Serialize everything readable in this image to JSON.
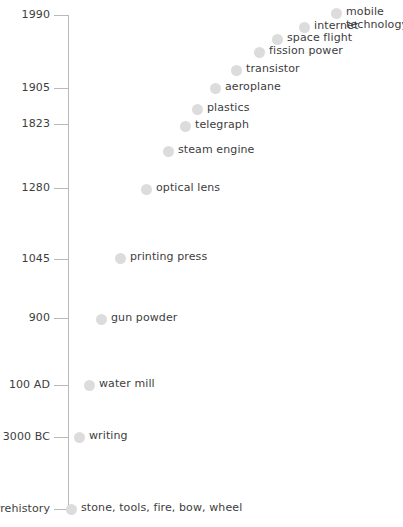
{
  "chart_data": {
    "type": "scatter",
    "title": "",
    "xlabel": "",
    "ylabel": "",
    "orientation": "vertical-timeline",
    "axis": {
      "line_color": "#b9b9b9",
      "x_px": 68,
      "top_px": 15,
      "bottom_px": 509
    },
    "dot_color": "#dcdcdc",
    "text_color": "#3d3d3d",
    "tick_labels": [
      "1990",
      "1905",
      "1823",
      "1280",
      "1045",
      "900",
      "100 AD",
      "3000 BC",
      "Prehistory"
    ],
    "ticks": [
      {
        "label": "1990",
        "y": 15,
        "label_right": 50,
        "tick_left": 54
      },
      {
        "label": "1905",
        "y": 88,
        "label_right": 50,
        "tick_left": 54
      },
      {
        "label": "1823",
        "y": 124,
        "label_right": 50,
        "tick_left": 54
      },
      {
        "label": "1280",
        "y": 188,
        "label_right": 50,
        "tick_left": 54
      },
      {
        "label": "1045",
        "y": 259,
        "label_right": 50,
        "tick_left": 54
      },
      {
        "label": "900",
        "y": 318,
        "label_right": 50,
        "tick_left": 54
      },
      {
        "label": "100 AD",
        "y": 385,
        "label_right": 50,
        "tick_left": 54
      },
      {
        "label": "3000 BC",
        "y": 437,
        "label_right": 50,
        "tick_left": 54
      },
      {
        "label": "Prehistory",
        "y": 509,
        "label_right": 50,
        "tick_left": 54
      }
    ],
    "events": [
      {
        "name": "mobile technology",
        "x": 331,
        "y": 8,
        "wrap": true
      },
      {
        "name": "internet",
        "x": 299,
        "y": 22,
        "wrap": false
      },
      {
        "name": "space flight",
        "x": 272,
        "y": 34,
        "wrap": false
      },
      {
        "name": "fission power",
        "x": 254,
        "y": 47,
        "wrap": false
      },
      {
        "name": "transistor",
        "x": 231,
        "y": 65,
        "wrap": false
      },
      {
        "name": "aeroplane",
        "x": 210,
        "y": 83,
        "wrap": false
      },
      {
        "name": "plastics",
        "x": 192,
        "y": 104,
        "wrap": false
      },
      {
        "name": "telegraph",
        "x": 180,
        "y": 121,
        "wrap": false
      },
      {
        "name": "steam engine",
        "x": 163,
        "y": 146,
        "wrap": false
      },
      {
        "name": "optical lens",
        "x": 141,
        "y": 184,
        "wrap": false
      },
      {
        "name": "printing press",
        "x": 115,
        "y": 253,
        "wrap": false
      },
      {
        "name": "gun powder",
        "x": 96,
        "y": 314,
        "wrap": false
      },
      {
        "name": "water mill",
        "x": 84,
        "y": 380,
        "wrap": false
      },
      {
        "name": "writing",
        "x": 74,
        "y": 432,
        "wrap": false
      },
      {
        "name": "stone, tools, fire, bow, wheel",
        "x": 66,
        "y": 504,
        "wrap": false
      }
    ]
  }
}
